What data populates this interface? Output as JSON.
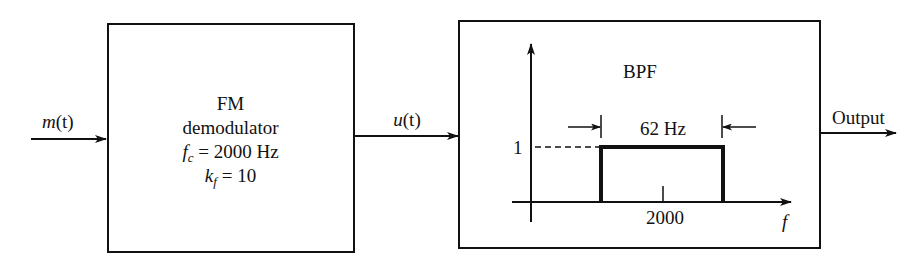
{
  "diagram": {
    "type": "block-diagram",
    "input": {
      "signal_label_var": "m",
      "signal_label_arg": "(t)"
    },
    "fm_demodulator": {
      "title": "FM",
      "subtitle": "demodulator",
      "fc_var": "f",
      "fc_sub": "c",
      "fc_value": " = 2000 Hz",
      "kf_var": "k",
      "kf_sub": "f",
      "kf_value": " = 10"
    },
    "intermediate": {
      "signal_label_var": "u",
      "signal_label_arg": "(t)"
    },
    "bpf": {
      "title": "BPF",
      "bandwidth_label": "62 Hz",
      "gain_label": "1",
      "center_freq_label": "2000",
      "freq_axis_label": "f"
    },
    "output": {
      "label": "Output"
    }
  },
  "colors": {
    "stroke": "#111111",
    "background": "#ffffff"
  }
}
